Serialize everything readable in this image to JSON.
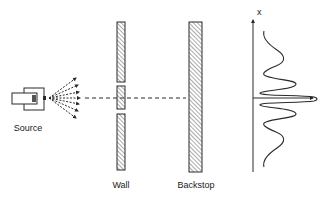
{
  "diagram": {
    "labels": {
      "source": "Source",
      "wall": "Wall",
      "backstop": "Backstop",
      "axis": "x"
    },
    "colors": {
      "line": "#2a2a2a",
      "hatch": "#555555",
      "background": "#ffffff"
    },
    "icons": {
      "source": "electron-gun-icon",
      "spray": "dashed-rays-arrows",
      "hatching": "diagonal-hatch"
    }
  }
}
